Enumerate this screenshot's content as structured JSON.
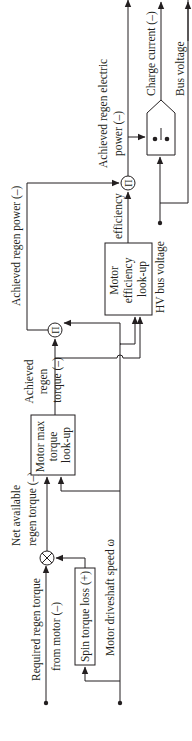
{
  "diagram": {
    "inputs": {
      "required_regen_torque": [
        "Required regen torque",
        "from motor (–)"
      ],
      "motor_speed": "Motor driveshaft speed ω",
      "hv_bus_voltage": "HV bus voltage"
    },
    "blocks": {
      "spin_loss": "Spin torque loss (+)",
      "max_torque": [
        "Motor max",
        "torque",
        "look-up"
      ],
      "efficiency": [
        "Motor",
        "efficiency",
        "look-up"
      ]
    },
    "signals": {
      "net_available": [
        "Net available",
        "regen torque (–)"
      ],
      "achieved_torque": [
        "Achieved",
        "regen",
        "torque (–)"
      ],
      "achieved_power": "Achieved regen power (–)",
      "efficiency": "efficiency",
      "achieved_electric_power": [
        "Achieved regen electric",
        "power (–)"
      ]
    },
    "outputs": {
      "charge_current": "Charge current (–)",
      "bus_voltage": "Bus voltage"
    },
    "operators": {
      "multiply_symbol": "⊗",
      "product_symbol": "Π"
    },
    "colors": {
      "line": "#231f20",
      "background": "#ffffff"
    }
  }
}
